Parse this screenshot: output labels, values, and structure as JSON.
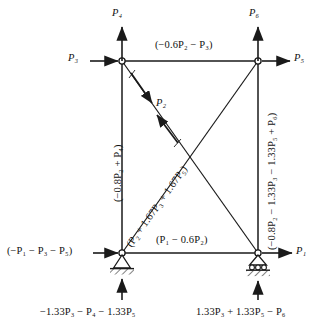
{
  "diagram": {
    "type": "truss-free-body-diagram",
    "stroke_color": "#1a1a1a",
    "background": "#ffffff",
    "nodes": [
      {
        "id": "top-left",
        "x": 122,
        "y": 61,
        "support": "none"
      },
      {
        "id": "top-right",
        "x": 258,
        "y": 61,
        "support": "none"
      },
      {
        "id": "bottom-left",
        "x": 122,
        "y": 253,
        "support": "pin"
      },
      {
        "id": "bottom-right",
        "x": 258,
        "y": 253,
        "support": "roller"
      }
    ],
    "members": [
      {
        "id": "top-chord",
        "from": "top-left",
        "to": "top-right",
        "label": "(−0.6P2 − P3)"
      },
      {
        "id": "bottom-chord",
        "from": "bottom-left",
        "to": "bottom-right",
        "label": "(P1 − 0.6P2)"
      },
      {
        "id": "left-column",
        "from": "top-left",
        "to": "bottom-left",
        "label": "(−0.8P2 + P4)"
      },
      {
        "id": "right-column",
        "from": "top-right",
        "to": "bottom-right",
        "label": "(−0.8P2 − 1.33P3 − 1.33P5 + P6)"
      },
      {
        "id": "diagonal-rising",
        "from": "bottom-left",
        "to": "top-right",
        "label": "(P2 + 1.67P3 + 1.67P5)"
      },
      {
        "id": "diagonal-falling",
        "from": "top-left",
        "to": "bottom-right",
        "label": ""
      }
    ]
  },
  "labels": {
    "top_chord": {
      "pre": "(−0.6",
      "p_a": "P",
      "sub_a": "2",
      "mid": " − ",
      "p_b": "P",
      "sub_b": "3",
      "post": ")"
    },
    "bottom_chord": {
      "pre": "(",
      "p_a": "P",
      "sub_a": "1",
      "mid": " − 0.6",
      "p_b": "P",
      "sub_b": "2",
      "post": ")"
    },
    "left_column": {
      "text": "(−0.8P₂ + P₄)"
    },
    "right_column": {
      "text": "(−0.8P₂ − 1.33P₃ − 1.33P₅ + P₆)"
    },
    "diagonal": {
      "text": "(P₂ + 1.67P₃ + 1.67P₅)"
    }
  },
  "forces": {
    "p1": {
      "name": "P",
      "sub": "1",
      "direction": "right",
      "applied_at": "bottom-right"
    },
    "p2": {
      "name": "P",
      "sub": "2",
      "direction": "double-arrow-along-falling-diagonal",
      "applied_at": "diagonal-falling"
    },
    "p3": {
      "name": "P",
      "sub": "3",
      "direction": "right",
      "applied_at": "top-left"
    },
    "p4": {
      "name": "P",
      "sub": "4",
      "direction": "up",
      "applied_at": "top-left"
    },
    "p5": {
      "name": "P",
      "sub": "5",
      "direction": "right",
      "applied_at": "top-right"
    },
    "p6": {
      "name": "P",
      "sub": "6",
      "direction": "up",
      "applied_at": "top-right"
    }
  },
  "reactions": {
    "left_horizontal": {
      "text": "(−P₁ − P₃ − P₅)",
      "direction": "right",
      "at": "bottom-left"
    },
    "left_vertical": {
      "text": "−1.33P₃ − P₄ − 1.33P₅",
      "direction": "up",
      "at": "bottom-left"
    },
    "right_vertical": {
      "text": "1.33P₃ + 1.33P₅ − P₆",
      "direction": "up",
      "at": "bottom-right"
    }
  }
}
